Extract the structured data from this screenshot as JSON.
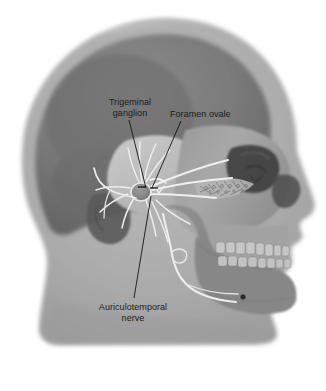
{
  "figure": {
    "background_color": "#ffffff",
    "width": 326,
    "height": 391
  },
  "labels": {
    "trigeminal_ganglion": {
      "line1": "Trigeminal",
      "line2": "ganglion"
    },
    "foramen_ovale": {
      "line1": "Foramen ovale"
    },
    "auriculotemporal_nerve": {
      "line1": "Auriculotemporal",
      "line2": "nerve"
    }
  },
  "colors": {
    "text": "#1c1c1c",
    "leader_line": "#141414",
    "soft_tissue": "#a9a9a9",
    "soft_tissue_light": "#b6b6b6",
    "cranium_dark": "#7b7b7b",
    "cranium_shadow": "#6e6e6e",
    "facial_skull": "#9d9d9d",
    "skull_highlight": "#bcbcbc",
    "mandible": "#8d8d8d",
    "cavity_dark": "#4a4a4a",
    "cavity_darker": "#343434",
    "nerve": "#f2f2f2",
    "nerve_dim": "#dcdcdc",
    "teeth": "#c8c8c8"
  },
  "anatomy": {
    "structures": [
      "soft-tissue-head-profile",
      "cranial-vault",
      "temporal-bone",
      "external-ear",
      "orbit",
      "nasal-cavity",
      "maxilla",
      "maxillary-teeth",
      "mandible",
      "mandibular-teeth",
      "mental-foramen",
      "trigeminal-ganglion",
      "mandibular-nerve-branches",
      "auriculotemporal-nerve",
      "inferior-alveolar-nerve",
      "foramen-ovale"
    ]
  }
}
